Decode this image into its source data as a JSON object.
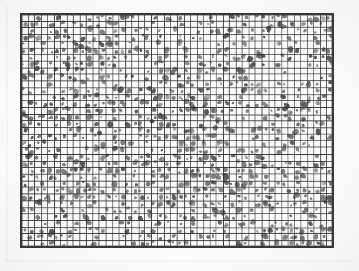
{
  "document": {
    "title": "Scanned graph-paper grid with ink marks",
    "media": "photocopy / scanned bitonal image",
    "caption": ""
  },
  "canvas": {
    "width": 359,
    "height": 271,
    "background_color": "#fdfdfd"
  },
  "chart_data": {
    "type": "heatmap",
    "title": "",
    "subtitle": "",
    "xlabel": "",
    "ylabel": "",
    "legend": [],
    "annotations": [],
    "grid": true,
    "axis_tick_labels_x": [],
    "axis_tick_labels_y": [],
    "description": "Dense rectangular lattice of small square cells drawn on graph paper; a large fraction of cells contain an irregular dark grey ink blob. Blobs vary in size and sometimes bleed across the ruled lines.",
    "grid_geometry": {
      "origin_x": 20,
      "origin_y": 13,
      "pixel_width": 314,
      "pixel_height": 235,
      "columns": 48,
      "rows": 35,
      "cell_width": 6.54,
      "cell_height": 6.71,
      "total_cells": 1680
    },
    "style": {
      "cell_fill": "#ffffff",
      "grid_line_color": "#2e2e2e",
      "outer_border_color": "#3a3a3a",
      "blob_color": "#7d7d7d",
      "blob_color_dark": "#5a5a5a",
      "grid_line_width": 1
    },
    "fill_statistics": {
      "filled_fraction": 0.52,
      "filled_cells_estimate": 874,
      "empty_cells_estimate": 806,
      "blob_radius_min_px": 1.1,
      "blob_radius_max_px": 2.6
    },
    "random_seed": 20240517
  }
}
